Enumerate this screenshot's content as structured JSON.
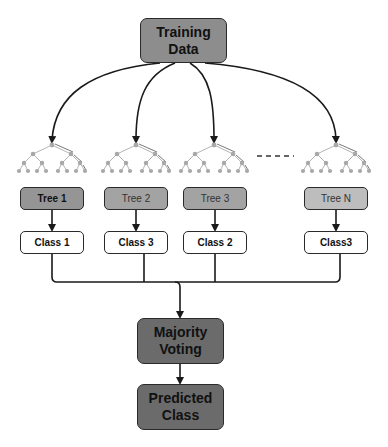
{
  "diagram": {
    "training_data": "Training\nData",
    "trees": [
      {
        "label": "Tree 1",
        "class": "Class 1"
      },
      {
        "label": "Tree 2",
        "class": "Class 3"
      },
      {
        "label": "Tree 3",
        "class": "Class 2"
      },
      {
        "label": "Tree N",
        "class": "Class3"
      }
    ],
    "ellipsis": "- - - - -",
    "majority_voting": "Majority\nVoting",
    "predicted_class": "Predicted\nClass",
    "colors": {
      "training_box": "#8d8d8d",
      "tree1_box": "#959595",
      "tree_box": "#a3a3a3",
      "treeN_box": "#bdbdbd",
      "class_box": "#ffffff",
      "voting_box": "#6b6b6b",
      "edge": "#1a1a1a",
      "tree_node": "#a8a8a8"
    }
  }
}
